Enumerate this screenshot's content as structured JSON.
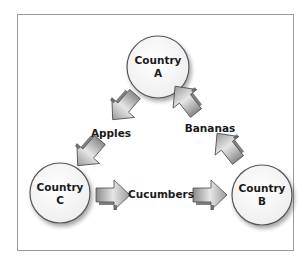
{
  "diagram": {
    "type": "trade-flow-triangle",
    "nodes": [
      {
        "id": "A",
        "line1": "Country",
        "line2": "A"
      },
      {
        "id": "B",
        "line1": "Country",
        "line2": "B"
      },
      {
        "id": "C",
        "line1": "Country",
        "line2": "C"
      }
    ],
    "flows": [
      {
        "from": "A",
        "to": "C",
        "label": "Apples"
      },
      {
        "from": "C",
        "to": "B",
        "label": "Cucumbers"
      },
      {
        "from": "B",
        "to": "A",
        "label": "Bananas"
      }
    ],
    "colors": {
      "frame": "#9a9a9a",
      "circle_fill": "#f7f7f7",
      "circle_stroke": "#555555",
      "arrow_light": "#e6e6e6",
      "arrow_dark": "#8a8a8a",
      "arrow_stroke": "#4a4a4a"
    }
  }
}
